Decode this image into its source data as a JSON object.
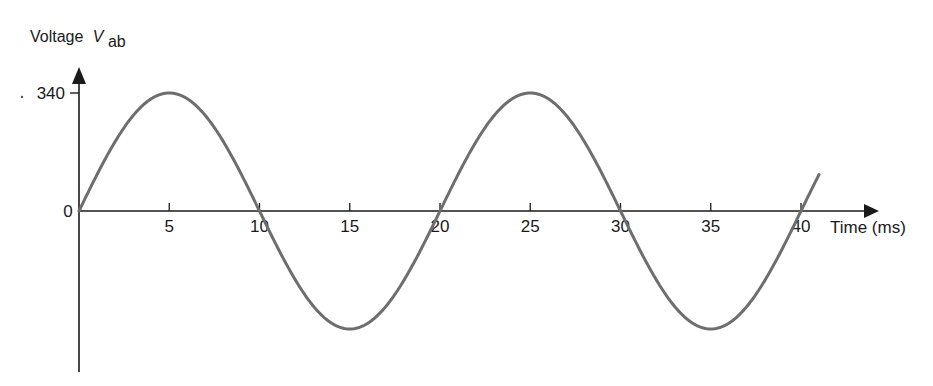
{
  "chart_data": {
    "type": "line",
    "title": "",
    "xlabel": "Time (ms)",
    "ylabel": "Voltage",
    "ylabel_symbol": "V",
    "ylabel_subscript": "ab",
    "x_ticks": [
      "5",
      "10",
      "15",
      "20",
      "25",
      "30",
      "35",
      "40"
    ],
    "x_tick_values": [
      5,
      10,
      15,
      20,
      25,
      30,
      35,
      40
    ],
    "y_ticks": [
      "340"
    ],
    "y_tick_values": [
      340
    ],
    "origin_label": "0",
    "xlim": [
      0,
      41.5
    ],
    "ylim": [
      -340,
      340
    ],
    "grid": false,
    "legend": null,
    "series": [
      {
        "name": "V_ab",
        "function": "340*sin(2*pi*t/20)",
        "amplitude": 340,
        "period_ms": 20,
        "frequency_hz": 50,
        "x": [
          0,
          2.5,
          5,
          7.5,
          10,
          12.5,
          15,
          17.5,
          20,
          22.5,
          25,
          27.5,
          30,
          32.5,
          35,
          37.5,
          40,
          41
        ],
        "values": [
          0,
          240,
          340,
          240,
          0,
          -240,
          -340,
          -240,
          0,
          240,
          340,
          240,
          0,
          -240,
          -340,
          -240,
          0,
          105
        ]
      }
    ],
    "colors": {
      "curve": "#6e6e6e",
      "axes": "#1a1a1a"
    }
  }
}
